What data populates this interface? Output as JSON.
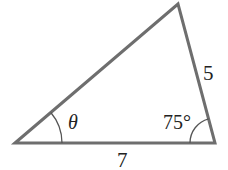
{
  "diagram": {
    "type": "triangle",
    "vertices": {
      "left": [
        15,
        143
      ],
      "top": [
        178,
        4
      ],
      "right": [
        215,
        143
      ]
    },
    "colors": {
      "stroke": "#6e6e6e",
      "arc": "#555555",
      "text": "#222222",
      "background": "#ffffff"
    },
    "labels": {
      "bottom_side": "7",
      "right_side": "5",
      "left_angle": "θ",
      "right_angle": "75°"
    }
  }
}
